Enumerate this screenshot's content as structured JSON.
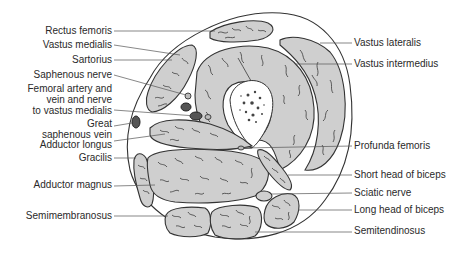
{
  "figure": {
    "colors": {
      "muscle_fill": "#cfcfcf",
      "outline": "#333333",
      "label_text": "#2a2a2a",
      "leader_line": "#555555",
      "background": "#ffffff"
    }
  },
  "labels_left": [
    {
      "id": "rectus-femoris",
      "lines": [
        "Rectus femoris"
      ]
    },
    {
      "id": "vastus-medialis",
      "lines": [
        "Vastus medialis"
      ]
    },
    {
      "id": "sartorius",
      "lines": [
        "Sartorius"
      ]
    },
    {
      "id": "saphenous-nerve",
      "lines": [
        "Saphenous nerve"
      ]
    },
    {
      "id": "femoral-artery",
      "lines": [
        "Femoral artery and",
        "vein and nerve",
        "to vastus medialis"
      ]
    },
    {
      "id": "great-saphenous-vein",
      "lines": [
        "Great",
        "saphenous vein"
      ]
    },
    {
      "id": "adductor-longus",
      "lines": [
        "Adductor longus"
      ]
    },
    {
      "id": "gracilis",
      "lines": [
        "Gracilis"
      ]
    },
    {
      "id": "adductor-magnus",
      "lines": [
        "Adductor magnus"
      ]
    },
    {
      "id": "semimembranosus",
      "lines": [
        "Semimembranosus"
      ]
    }
  ],
  "labels_right": [
    {
      "id": "vastus-lateralis",
      "lines": [
        "Vastus lateralis"
      ]
    },
    {
      "id": "vastus-intermedius",
      "lines": [
        "Vastus intermedius"
      ]
    },
    {
      "id": "profunda-femoris",
      "lines": [
        "Profunda femoris"
      ]
    },
    {
      "id": "short-head-biceps",
      "lines": [
        "Short head of biceps"
      ]
    },
    {
      "id": "sciatic-nerve",
      "lines": [
        "Sciatic nerve"
      ]
    },
    {
      "id": "long-head-biceps",
      "lines": [
        "Long head of biceps"
      ]
    },
    {
      "id": "semitendinosus",
      "lines": [
        "Semitendinosus"
      ]
    }
  ]
}
